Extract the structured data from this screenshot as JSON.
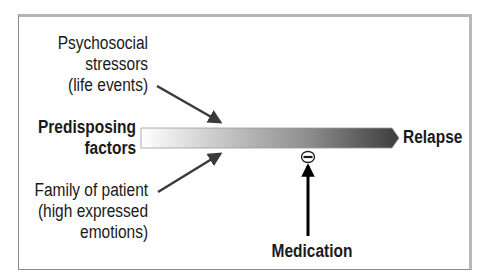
{
  "diagram": {
    "type": "relapse-pathway",
    "inputs": {
      "top": {
        "lines": [
          "Psychosocial",
          "stressors",
          "(life events)"
        ]
      },
      "left": {
        "lines": [
          "Predisposing",
          "factors"
        ]
      },
      "bottom": {
        "lines": [
          "Family of patient",
          "(high expressed",
          "emotions)"
        ]
      }
    },
    "outcome": {
      "label": "Relapse"
    },
    "inhibitor": {
      "label": "Medication",
      "effect_symbol": "minus-circle",
      "effect": "inhibits"
    },
    "colors": {
      "bar_start": "#ffffff",
      "bar_end": "#3c3c3c",
      "arrow": "#3a3a3a",
      "text": "#1a1a1a",
      "frame": "#b4b4b4"
    }
  }
}
